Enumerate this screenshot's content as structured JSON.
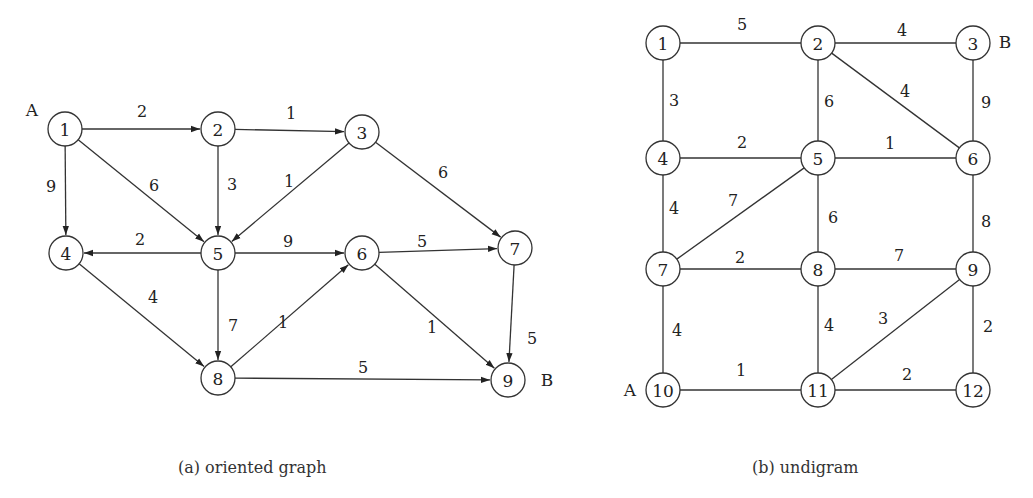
{
  "figure_a": {
    "caption": "(a) oriented graph",
    "directed": true,
    "nodes": [
      {
        "id": "1",
        "x": 65,
        "y": 129
      },
      {
        "id": "2",
        "x": 218,
        "y": 129
      },
      {
        "id": "3",
        "x": 362,
        "y": 132
      },
      {
        "id": "4",
        "x": 66,
        "y": 253
      },
      {
        "id": "5",
        "x": 218,
        "y": 253
      },
      {
        "id": "6",
        "x": 362,
        "y": 253
      },
      {
        "id": "7",
        "x": 515,
        "y": 248
      },
      {
        "id": "8",
        "x": 218,
        "y": 378
      },
      {
        "id": "9",
        "x": 508,
        "y": 380
      }
    ],
    "edges": [
      {
        "from": "1",
        "to": "2",
        "w": "2",
        "lx": 142,
        "ly": 111
      },
      {
        "from": "2",
        "to": "3",
        "w": "1",
        "lx": 291,
        "ly": 113
      },
      {
        "from": "1",
        "to": "4",
        "w": "9",
        "lx": 51,
        "ly": 186
      },
      {
        "from": "1",
        "to": "5",
        "w": "6",
        "lx": 154,
        "ly": 185
      },
      {
        "from": "2",
        "to": "5",
        "w": "3",
        "lx": 232,
        "ly": 184
      },
      {
        "from": "3",
        "to": "5",
        "w": "1",
        "lx": 289,
        "ly": 181
      },
      {
        "from": "3",
        "to": "7",
        "w": "6",
        "lx": 443,
        "ly": 172
      },
      {
        "from": "5",
        "to": "4",
        "w": "2",
        "lx": 140,
        "ly": 239
      },
      {
        "from": "5",
        "to": "6",
        "w": "9",
        "lx": 288,
        "ly": 241
      },
      {
        "from": "6",
        "to": "7",
        "w": "5",
        "lx": 422,
        "ly": 241
      },
      {
        "from": "4",
        "to": "8",
        "w": "4",
        "lx": 153,
        "ly": 297
      },
      {
        "from": "5",
        "to": "8",
        "w": "7",
        "lx": 233,
        "ly": 325
      },
      {
        "from": "8",
        "to": "6",
        "w": "1",
        "lx": 283,
        "ly": 322
      },
      {
        "from": "6",
        "to": "9",
        "w": "1",
        "lx": 432,
        "ly": 327
      },
      {
        "from": "7",
        "to": "9",
        "w": "5",
        "lx": 532,
        "ly": 338
      },
      {
        "from": "8",
        "to": "9",
        "w": "5",
        "lx": 363,
        "ly": 367
      }
    ],
    "tags": [
      {
        "text": "A",
        "x": 32,
        "y": 110
      },
      {
        "text": "B",
        "x": 547,
        "y": 380
      }
    ]
  },
  "figure_b": {
    "caption": "(b) undigram",
    "directed": false,
    "nodes": [
      {
        "id": "1",
        "x": 663,
        "y": 43
      },
      {
        "id": "2",
        "x": 818,
        "y": 43
      },
      {
        "id": "3",
        "x": 973,
        "y": 43
      },
      {
        "id": "4",
        "x": 663,
        "y": 158
      },
      {
        "id": "5",
        "x": 818,
        "y": 158
      },
      {
        "id": "6",
        "x": 973,
        "y": 158
      },
      {
        "id": "7",
        "x": 663,
        "y": 269
      },
      {
        "id": "8",
        "x": 818,
        "y": 269
      },
      {
        "id": "9",
        "x": 973,
        "y": 269
      },
      {
        "id": "10",
        "x": 663,
        "y": 390
      },
      {
        "id": "11",
        "x": 818,
        "y": 390
      },
      {
        "id": "12",
        "x": 973,
        "y": 390
      }
    ],
    "edges": [
      {
        "from": "1",
        "to": "2",
        "w": "5",
        "lx": 742,
        "ly": 24
      },
      {
        "from": "2",
        "to": "3",
        "w": "4",
        "lx": 902,
        "ly": 30
      },
      {
        "from": "1",
        "to": "4",
        "w": "3",
        "lx": 674,
        "ly": 100
      },
      {
        "from": "2",
        "to": "5",
        "w": "6",
        "lx": 829,
        "ly": 101
      },
      {
        "from": "2",
        "to": "6",
        "w": "4",
        "lx": 905,
        "ly": 91
      },
      {
        "from": "3",
        "to": "6",
        "w": "9",
        "lx": 986,
        "ly": 102
      },
      {
        "from": "4",
        "to": "5",
        "w": "2",
        "lx": 742,
        "ly": 142
      },
      {
        "from": "5",
        "to": "6",
        "w": "1",
        "lx": 890,
        "ly": 143
      },
      {
        "from": "4",
        "to": "7",
        "w": "4",
        "lx": 674,
        "ly": 208
      },
      {
        "from": "5",
        "to": "7",
        "w": "7",
        "lx": 733,
        "ly": 200
      },
      {
        "from": "5",
        "to": "8",
        "w": "6",
        "lx": 833,
        "ly": 217
      },
      {
        "from": "6",
        "to": "9",
        "w": "8",
        "lx": 986,
        "ly": 221
      },
      {
        "from": "7",
        "to": "8",
        "w": "2",
        "lx": 740,
        "ly": 257
      },
      {
        "from": "8",
        "to": "9",
        "w": "7",
        "lx": 899,
        "ly": 255
      },
      {
        "from": "7",
        "to": "10",
        "w": "4",
        "lx": 677,
        "ly": 330
      },
      {
        "from": "8",
        "to": "11",
        "w": "4",
        "lx": 829,
        "ly": 325
      },
      {
        "from": "11",
        "to": "9",
        "w": "3",
        "lx": 883,
        "ly": 318
      },
      {
        "from": "9",
        "to": "12",
        "w": "2",
        "lx": 988,
        "ly": 326
      },
      {
        "from": "10",
        "to": "11",
        "w": "1",
        "lx": 741,
        "ly": 370
      },
      {
        "from": "11",
        "to": "12",
        "w": "2",
        "lx": 907,
        "ly": 374
      }
    ],
    "tags": [
      {
        "text": "B",
        "x": 1005,
        "y": 42
      },
      {
        "text": "A",
        "x": 630,
        "y": 390
      }
    ]
  }
}
